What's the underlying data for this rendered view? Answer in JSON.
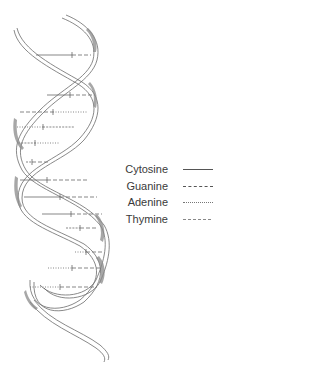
{
  "diagram": {
    "colors": {
      "strand_outline": "#6b6b6b",
      "strand_shade": "#8a8a8a",
      "rung": "#555555",
      "text": "#3a3a3a"
    },
    "base_pairs": [
      {
        "y": 55,
        "x1": 36,
        "x2": 91,
        "tick": 72,
        "left": "cytosine",
        "right": "guanine"
      },
      {
        "y": 95,
        "x1": 47,
        "x2": 95,
        "tick": 70,
        "left": "cytosine",
        "right": "guanine"
      },
      {
        "y": 112,
        "x1": 20,
        "x2": 88,
        "tick": 53,
        "left": "guanine",
        "right": "adenine"
      },
      {
        "y": 127,
        "x1": 17,
        "x2": 75,
        "tick": 43,
        "left": "adenine",
        "right": "thymine"
      },
      {
        "y": 143,
        "x1": 18,
        "x2": 60,
        "tick": 35,
        "left": "thymine",
        "right": "adenine"
      },
      {
        "y": 162,
        "x1": 26,
        "x2": 48,
        "tick": 32,
        "left": "thymine",
        "right": "guanine"
      },
      {
        "y": 180,
        "x1": 20,
        "x2": 88,
        "tick": 47,
        "left": "cytosine",
        "right": "guanine"
      },
      {
        "y": 197,
        "x1": 24,
        "x2": 97,
        "tick": 60,
        "left": "cytosine",
        "right": "guanine"
      },
      {
        "y": 214,
        "x1": 42,
        "x2": 102,
        "tick": 71,
        "left": "cytosine",
        "right": "guanine"
      },
      {
        "y": 228,
        "x1": 66,
        "x2": 97,
        "tick": 80,
        "left": "thymine",
        "right": "guanine"
      },
      {
        "y": 252,
        "x1": 75,
        "x2": 102,
        "tick": 86,
        "left": "adenine",
        "right": "guanine"
      },
      {
        "y": 268,
        "x1": 48,
        "x2": 102,
        "tick": 72,
        "left": "adenine",
        "right": "guanine"
      },
      {
        "y": 287,
        "x1": 30,
        "x2": 97,
        "tick": 60,
        "left": "adenine",
        "right": "guanine"
      }
    ]
  },
  "legend": {
    "items": [
      {
        "label": "Cytosine",
        "style": "solid"
      },
      {
        "label": "Guanine",
        "style": "dashed"
      },
      {
        "label": "Adenine",
        "style": "dotted"
      },
      {
        "label": "Thymine",
        "style": "fine-dashed"
      }
    ]
  }
}
